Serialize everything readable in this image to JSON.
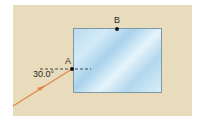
{
  "diagram": {
    "points": [
      {
        "label": "A",
        "x": 72,
        "y": 69
      },
      {
        "label": "B",
        "x": 117,
        "y": 29
      }
    ],
    "angle_label": "30.0°",
    "colors": {
      "background": "#e8dcbc",
      "glass": "#b9dcef",
      "ray": "#e0884a",
      "normal": "#333333"
    },
    "ray": {
      "from": [
        13,
        106
      ],
      "to": [
        72,
        69
      ]
    },
    "normal_line": {
      "from": [
        40,
        69
      ],
      "to": [
        91,
        69
      ]
    },
    "glass_rect": {
      "x": 73,
      "y": 28,
      "width": 89,
      "height": 65
    }
  }
}
